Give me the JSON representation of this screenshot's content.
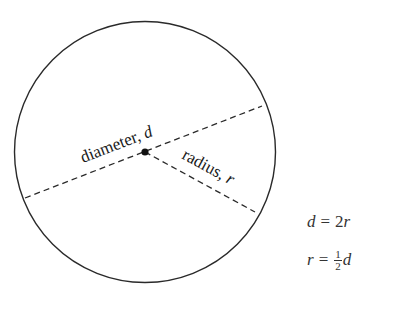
{
  "diagram": {
    "type": "circle-geometry",
    "circle": {
      "cx": 145,
      "cy": 152,
      "r": 130,
      "stroke": "#2a2a2a"
    },
    "center_point": {
      "x": 145,
      "y": 152
    },
    "diameter_line": {
      "x1": 25,
      "y1": 198,
      "x2": 262,
      "y2": 106,
      "style": "dashed"
    },
    "radius_line": {
      "x1": 145,
      "y1": 152,
      "x2": 255,
      "y2": 212,
      "style": "dashed"
    },
    "labels": {
      "diameter_word": "diameter, ",
      "diameter_var": "d",
      "radius_word": "radius, ",
      "radius_var": "r"
    }
  },
  "formulas": {
    "f1": {
      "lhs": "d",
      "op": "=",
      "rhs_num": "2",
      "rhs_var": "r"
    },
    "f2": {
      "lhs": "r",
      "op": "=",
      "frac_num": "1",
      "frac_den": "2",
      "rhs_var": "d"
    }
  }
}
